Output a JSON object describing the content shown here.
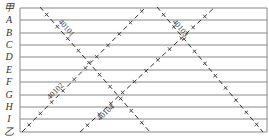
{
  "rows": [
    {
      "label": "甲",
      "y": 8
    },
    {
      "label": "A",
      "y": 20
    },
    {
      "label": "B",
      "y": 33
    },
    {
      "label": "C",
      "y": 45
    },
    {
      "label": "D",
      "y": 57
    },
    {
      "label": "E",
      "y": 70
    },
    {
      "label": "F",
      "y": 82
    },
    {
      "label": "G",
      "y": 95
    },
    {
      "label": "H",
      "y": 107
    },
    {
      "label": "I",
      "y": 119
    },
    {
      "label": "乙",
      "y": 132
    }
  ],
  "lines": [
    {
      "id": "40101",
      "label": "40101",
      "x1": 40,
      "y1": 7,
      "x2": 150,
      "y2": 132,
      "label_x": 58,
      "label_y": 22
    },
    {
      "id": "40102",
      "label": "40102",
      "x1": 22,
      "y1": 132,
      "x2": 146,
      "y2": 7,
      "label_x": 50,
      "label_y": 100
    },
    {
      "id": "40103",
      "label": "40103",
      "x1": 157,
      "y1": 7,
      "x2": 263,
      "y2": 132,
      "label_x": 172,
      "label_y": 22
    },
    {
      "id": "40104",
      "label": "40104",
      "x1": 80,
      "y1": 132,
      "x2": 215,
      "y2": 7,
      "label_x": 100,
      "label_y": 121
    }
  ],
  "colors": {
    "grid": "#888888",
    "line": "#333333",
    "text": "#333333"
  }
}
